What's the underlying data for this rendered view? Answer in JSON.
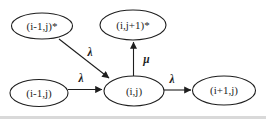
{
  "diagram": {
    "background": "#ffffff",
    "ink": "#1e1e1e",
    "bottom_edge_color": "#d9d9d9",
    "nodes": {
      "top_left": {
        "label": "(i-1,j)*"
      },
      "top_mid": {
        "label": "(i,j+1)*"
      },
      "bottom_left": {
        "label": "(i-1,j)"
      },
      "bottom_mid": {
        "label": "(i,j)"
      },
      "bottom_right": {
        "label": "(i+1,j)"
      }
    },
    "edges": {
      "diag_lambda": {
        "label": "λ"
      },
      "left_lambda": {
        "label": "λ"
      },
      "up_mu": {
        "label": "μ"
      },
      "right_lambda": {
        "label": "λ"
      }
    }
  }
}
